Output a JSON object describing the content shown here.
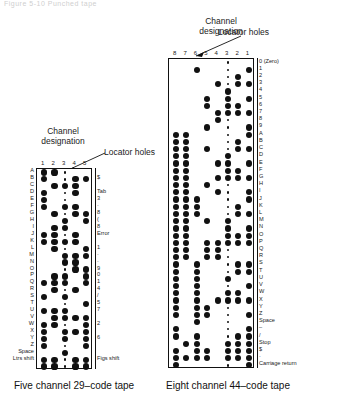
{
  "figure": {
    "top_fragment": "Figure 5-10  Punched tape",
    "captions": {
      "left": "Five channel 29–code tape",
      "right": "Eight channel 44–code tape"
    }
  },
  "labels": {
    "channel_designation": "Channel\ndesignation",
    "channel_designation_line1": "Channel",
    "channel_designation_line2": "designation",
    "locator_holes": "Locator holes"
  },
  "left_tape": {
    "name": "Five channel 29-code tape",
    "channels": [
      "1",
      "2",
      "3",
      "4",
      "5"
    ],
    "locator_channel_index": 2,
    "rows": [
      {
        "left": "A",
        "right": "",
        "holes": [
          1,
          1,
          0,
          0,
          0
        ]
      },
      {
        "left": "B",
        "right": "$",
        "holes": [
          1,
          0,
          0,
          1,
          1
        ]
      },
      {
        "left": "C",
        "right": "",
        "holes": [
          0,
          1,
          1,
          1,
          0
        ]
      },
      {
        "left": "D",
        "right": "Tab",
        "holes": [
          1,
          0,
          0,
          1,
          0
        ]
      },
      {
        "left": "E",
        "right": "3",
        "holes": [
          1,
          0,
          0,
          0,
          0
        ]
      },
      {
        "left": "F",
        "right": "·",
        "holes": [
          1,
          0,
          1,
          1,
          0
        ]
      },
      {
        "left": "G",
        "right": "8",
        "holes": [
          0,
          1,
          0,
          1,
          1
        ]
      },
      {
        "left": "H",
        "right": "(",
        "holes": [
          0,
          0,
          1,
          0,
          1
        ]
      },
      {
        "left": "I",
        "right": "8",
        "holes": [
          0,
          1,
          1,
          0,
          0
        ]
      },
      {
        "left": "J",
        "right": "Error",
        "holes": [
          1,
          1,
          0,
          1,
          0
        ]
      },
      {
        "left": "K",
        "right": "",
        "holes": [
          1,
          1,
          1,
          1,
          0
        ]
      },
      {
        "left": "L",
        "right": "1",
        "holes": [
          0,
          1,
          0,
          0,
          1
        ]
      },
      {
        "left": "M",
        "right": "·",
        "holes": [
          0,
          0,
          1,
          1,
          1
        ]
      },
      {
        "left": "N",
        "right": "·",
        "holes": [
          0,
          0,
          1,
          1,
          0
        ]
      },
      {
        "left": "O",
        "right": "9",
        "holes": [
          0,
          0,
          0,
          1,
          1
        ]
      },
      {
        "left": "P",
        "right": "0",
        "holes": [
          0,
          1,
          1,
          0,
          1
        ]
      },
      {
        "left": "Q",
        "right": "1",
        "holes": [
          1,
          1,
          1,
          0,
          1
        ]
      },
      {
        "left": "R",
        "right": "4",
        "holes": [
          0,
          1,
          0,
          1,
          0
        ]
      },
      {
        "left": "S",
        "right": "/",
        "holes": [
          1,
          0,
          1,
          0,
          0
        ]
      },
      {
        "left": "T",
        "right": "5",
        "holes": [
          0,
          0,
          0,
          0,
          1
        ]
      },
      {
        "left": "U",
        "right": "7",
        "holes": [
          1,
          1,
          1,
          0,
          0
        ]
      },
      {
        "left": "V",
        "right": "",
        "holes": [
          0,
          1,
          1,
          1,
          1
        ]
      },
      {
        "left": "W",
        "right": "2",
        "holes": [
          1,
          1,
          0,
          0,
          1
        ]
      },
      {
        "left": "X",
        "right": "",
        "holes": [
          1,
          0,
          1,
          1,
          1
        ]
      },
      {
        "left": "Y",
        "right": "6",
        "holes": [
          1,
          0,
          1,
          0,
          1
        ]
      },
      {
        "left": "Z",
        "right": "",
        "holes": [
          1,
          0,
          0,
          0,
          1
        ]
      },
      {
        "left": "Space",
        "right": "",
        "holes": [
          0,
          0,
          1,
          0,
          0
        ]
      },
      {
        "left": "Ltrs shift",
        "right": "Figs shift",
        "holes": [
          1,
          1,
          0,
          1,
          1
        ]
      },
      {
        "left": "",
        "right": "",
        "holes": [
          1,
          1,
          0,
          1,
          1
        ]
      }
    ]
  },
  "right_tape": {
    "name": "Eight channel 44-code tape",
    "channels": [
      "8",
      "7",
      "6",
      "5",
      "4",
      "3",
      "2",
      "1"
    ],
    "locator_channel_index": 5,
    "rows": [
      {
        "label": "0 (Zero)",
        "holes": [
          0,
          0,
          0,
          0,
          0,
          0,
          0,
          0
        ]
      },
      {
        "label": "1",
        "holes": [
          0,
          0,
          1,
          0,
          0,
          0,
          0,
          1
        ]
      },
      {
        "label": "2",
        "holes": [
          0,
          0,
          0,
          0,
          0,
          0,
          1,
          0
        ]
      },
      {
        "label": "3",
        "holes": [
          0,
          0,
          0,
          0,
          1,
          0,
          1,
          1
        ]
      },
      {
        "label": "4",
        "holes": [
          0,
          0,
          0,
          0,
          0,
          1,
          0,
          0
        ]
      },
      {
        "label": "5",
        "holes": [
          0,
          0,
          0,
          1,
          0,
          1,
          0,
          1
        ]
      },
      {
        "label": "6",
        "holes": [
          0,
          0,
          0,
          1,
          0,
          1,
          1,
          0
        ]
      },
      {
        "label": "7",
        "holes": [
          0,
          0,
          0,
          0,
          1,
          1,
          1,
          1
        ]
      },
      {
        "label": "8",
        "holes": [
          0,
          0,
          0,
          0,
          1,
          0,
          0,
          0
        ]
      },
      {
        "label": "9",
        "holes": [
          0,
          0,
          0,
          1,
          0,
          0,
          0,
          1
        ]
      },
      {
        "label": "A",
        "holes": [
          1,
          1,
          0,
          0,
          0,
          0,
          0,
          1
        ]
      },
      {
        "label": "B",
        "holes": [
          1,
          1,
          0,
          0,
          0,
          0,
          1,
          0
        ]
      },
      {
        "label": "C",
        "holes": [
          1,
          1,
          0,
          1,
          0,
          0,
          1,
          1
        ]
      },
      {
        "label": "D",
        "holes": [
          1,
          1,
          0,
          0,
          0,
          1,
          0,
          0
        ]
      },
      {
        "label": "E",
        "holes": [
          1,
          1,
          0,
          0,
          1,
          1,
          0,
          1
        ]
      },
      {
        "label": "F",
        "holes": [
          1,
          1,
          0,
          0,
          0,
          1,
          1,
          0
        ]
      },
      {
        "label": "G",
        "holes": [
          1,
          1,
          0,
          0,
          1,
          1,
          1,
          1
        ]
      },
      {
        "label": "H",
        "holes": [
          1,
          1,
          0,
          1,
          0,
          0,
          0,
          0
        ]
      },
      {
        "label": "I",
        "holes": [
          1,
          1,
          0,
          0,
          1,
          0,
          0,
          1
        ]
      },
      {
        "label": "J",
        "holes": [
          1,
          1,
          1,
          0,
          0,
          0,
          0,
          1
        ]
      },
      {
        "label": "K",
        "holes": [
          1,
          1,
          1,
          0,
          0,
          0,
          1,
          0
        ]
      },
      {
        "label": "L",
        "holes": [
          1,
          1,
          1,
          0,
          0,
          0,
          1,
          1
        ]
      },
      {
        "label": "M",
        "holes": [
          1,
          1,
          0,
          1,
          0,
          1,
          0,
          0
        ]
      },
      {
        "label": "N",
        "holes": [
          1,
          1,
          0,
          0,
          0,
          1,
          0,
          1
        ]
      },
      {
        "label": "O",
        "holes": [
          1,
          1,
          0,
          0,
          0,
          1,
          1,
          1
        ]
      },
      {
        "label": "P",
        "holes": [
          1,
          1,
          0,
          1,
          1,
          1,
          1,
          1
        ]
      },
      {
        "label": "Q",
        "holes": [
          1,
          1,
          0,
          1,
          1,
          0,
          0,
          0
        ]
      },
      {
        "label": "R",
        "holes": [
          1,
          1,
          0,
          1,
          1,
          0,
          0,
          0
        ]
      },
      {
        "label": "S",
        "holes": [
          1,
          0,
          1,
          0,
          0,
          0,
          1,
          1
        ]
      },
      {
        "label": "T",
        "holes": [
          1,
          0,
          1,
          0,
          0,
          0,
          1,
          1
        ]
      },
      {
        "label": "U",
        "holes": [
          1,
          0,
          1,
          0,
          0,
          1,
          0,
          0
        ]
      },
      {
        "label": "V",
        "holes": [
          1,
          0,
          1,
          0,
          0,
          0,
          0,
          1
        ]
      },
      {
        "label": "W",
        "holes": [
          1,
          0,
          1,
          0,
          0,
          1,
          1,
          0
        ]
      },
      {
        "label": "X",
        "holes": [
          1,
          0,
          1,
          0,
          1,
          1,
          1,
          1
        ]
      },
      {
        "label": "Y",
        "holes": [
          1,
          0,
          1,
          1,
          0,
          0,
          0,
          0
        ]
      },
      {
        "label": "Z",
        "holes": [
          1,
          0,
          1,
          1,
          0,
          0,
          0,
          1
        ]
      },
      {
        "label": "Space",
        "holes": [
          0,
          0,
          1,
          0,
          0,
          0,
          0,
          0
        ]
      },
      {
        "label": "–",
        "holes": [
          1,
          0,
          0,
          0,
          0,
          0,
          0,
          1
        ]
      },
      {
        "label": "/",
        "holes": [
          1,
          0,
          1,
          0,
          0,
          0,
          1,
          1
        ]
      },
      {
        "label": "Stop",
        "holes": [
          0,
          1,
          1,
          0,
          0,
          1,
          1,
          1
        ]
      },
      {
        "label": "$",
        "holes": [
          1,
          0,
          1,
          1,
          0,
          1,
          1,
          1
        ]
      },
      {
        "label": "·",
        "holes": [
          1,
          1,
          1,
          1,
          0,
          1,
          1,
          1
        ]
      },
      {
        "label": "Carriage return",
        "holes": [
          1,
          0,
          0,
          0,
          0,
          0,
          0,
          1
        ]
      }
    ]
  }
}
